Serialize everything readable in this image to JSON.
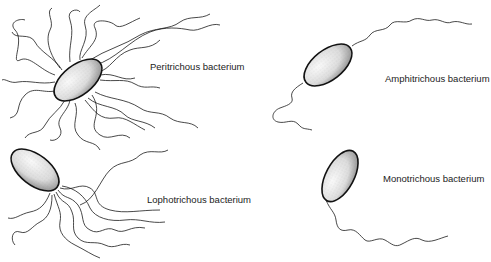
{
  "diagram": {
    "colors": {
      "ink": "#1a1a1a",
      "cell_fill": "#e8e8e8",
      "background": "#ffffff"
    },
    "labels": {
      "peritrichous": "Peritrichous bacterium",
      "amphitrichous": "Amphitrichous bacterium",
      "lophotrichous": "Lophotrichous bacterium",
      "monotrichous": "Monotrichous bacterium"
    }
  }
}
